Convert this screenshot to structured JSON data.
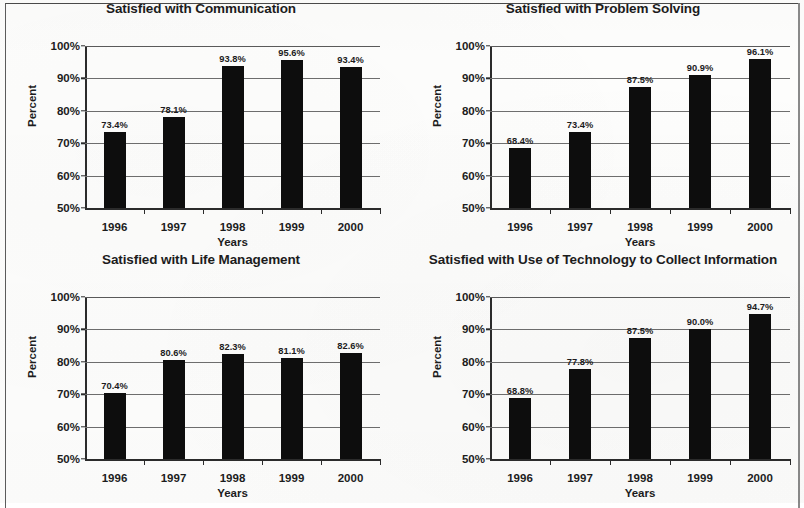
{
  "page": {
    "background_color": "#fdfdfc",
    "border_color": "#5c5c5c"
  },
  "axis": {
    "y_title": "Percent",
    "x_title": "Years",
    "y_ticks": [
      "100%",
      "90%",
      "80%",
      "70%",
      "60%",
      "50%"
    ],
    "x_ticks": [
      "1996",
      "1997",
      "1998",
      "1999",
      "2000"
    ]
  },
  "charts": [
    {
      "id": "communication",
      "title": "Satisfied with Communication",
      "labels": [
        "73.4%",
        "78.1%",
        "93.8%",
        "95.6%",
        "93.4%"
      ]
    },
    {
      "id": "problem-solving",
      "title": "Satisfied with Problem Solving",
      "labels": [
        "68.4%",
        "73.4%",
        "87.5%",
        "90.9%",
        "96.1%"
      ]
    },
    {
      "id": "life-management",
      "title": "Satisfied with Life Management",
      "labels": [
        "70.4%",
        "80.6%",
        "82.3%",
        "81.1%",
        "82.6%"
      ]
    },
    {
      "id": "technology",
      "title": "Satisfied with Use of Technology to Collect Information",
      "labels": [
        "68.8%",
        "77.8%",
        "87.5%",
        "90.0%",
        "94.7%"
      ]
    }
  ],
  "chart_data": [
    {
      "type": "bar",
      "title": "Satisfied with Communication",
      "xlabel": "Years",
      "ylabel": "Percent",
      "categories": [
        "1996",
        "1997",
        "1998",
        "1999",
        "2000"
      ],
      "values": [
        73.4,
        78.1,
        93.8,
        95.6,
        93.4
      ],
      "data_labels": [
        "73.4%",
        "78.1%",
        "93.8%",
        "95.6%",
        "93.4%"
      ],
      "ylim": [
        50,
        100
      ],
      "ytick_values": [
        50,
        60,
        70,
        80,
        90,
        100
      ],
      "ytick_labels": [
        "50%",
        "60%",
        "70%",
        "80%",
        "90%",
        "100%"
      ],
      "grid": true,
      "legend": null,
      "bar_color": "#0d0d0d"
    },
    {
      "type": "bar",
      "title": "Satisfied with Problem Solving",
      "xlabel": "Years",
      "ylabel": "Percent",
      "categories": [
        "1996",
        "1997",
        "1998",
        "1999",
        "2000"
      ],
      "values": [
        68.4,
        73.4,
        87.5,
        90.9,
        96.1
      ],
      "data_labels": [
        "68.4%",
        "73.4%",
        "87.5%",
        "90.9%",
        "96.1%"
      ],
      "ylim": [
        50,
        100
      ],
      "ytick_values": [
        50,
        60,
        70,
        80,
        90,
        100
      ],
      "ytick_labels": [
        "50%",
        "60%",
        "70%",
        "80%",
        "90%",
        "100%"
      ],
      "grid": true,
      "legend": null,
      "bar_color": "#0d0d0d"
    },
    {
      "type": "bar",
      "title": "Satisfied with Life Management",
      "xlabel": "Years",
      "ylabel": "Percent",
      "categories": [
        "1996",
        "1997",
        "1998",
        "1999",
        "2000"
      ],
      "values": [
        70.4,
        80.6,
        82.3,
        81.1,
        82.6
      ],
      "data_labels": [
        "70.4%",
        "80.6%",
        "82.3%",
        "81.1%",
        "82.6%"
      ],
      "ylim": [
        50,
        100
      ],
      "ytick_values": [
        50,
        60,
        70,
        80,
        90,
        100
      ],
      "ytick_labels": [
        "50%",
        "60%",
        "70%",
        "80%",
        "90%",
        "100%"
      ],
      "grid": true,
      "legend": null,
      "bar_color": "#0d0d0d"
    },
    {
      "type": "bar",
      "title": "Satisfied with Use of Technology to Collect Information",
      "xlabel": "Years",
      "ylabel": "Percent",
      "categories": [
        "1996",
        "1997",
        "1998",
        "1999",
        "2000"
      ],
      "values": [
        68.8,
        77.8,
        87.5,
        90.0,
        94.7
      ],
      "data_labels": [
        "68.8%",
        "77.8%",
        "87.5%",
        "90.0%",
        "94.7%"
      ],
      "ylim": [
        50,
        100
      ],
      "ytick_values": [
        50,
        60,
        70,
        80,
        90,
        100
      ],
      "ytick_labels": [
        "50%",
        "60%",
        "70%",
        "80%",
        "90%",
        "100%"
      ],
      "grid": true,
      "legend": null,
      "bar_color": "#0d0d0d"
    }
  ]
}
